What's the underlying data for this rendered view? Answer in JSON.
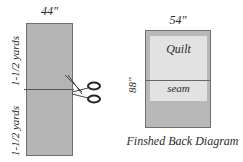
{
  "left_diagram": {
    "width_label": "44\"",
    "upper_length_label": "1-1/2 yards",
    "lower_length_label": "1-1/2 yards",
    "cut_icon": "scissors-icon"
  },
  "right_diagram": {
    "width_label": "54\"",
    "height_label": "88\"",
    "quilt_label": "Quilt",
    "seam_label": "seam",
    "caption": "Finshed Back Diagram"
  },
  "colors": {
    "fabric": "#b4b4b4",
    "quilt_area": "#e2e2e2",
    "outline": "#6f6f6f"
  }
}
